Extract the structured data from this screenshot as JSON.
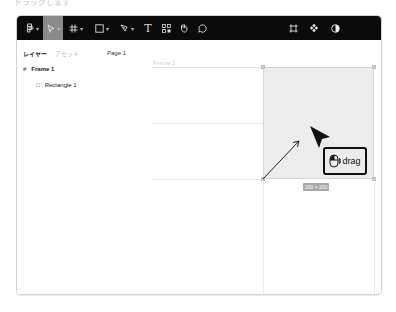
{
  "caption": "ドラッグします",
  "toolbar": {
    "tools": [
      {
        "name": "main-menu",
        "icon": "figma-logo-icon",
        "has_caret": true,
        "active": false
      },
      {
        "name": "move",
        "icon": "cursor-icon",
        "has_caret": true,
        "active": true
      },
      {
        "name": "frame",
        "icon": "frame-hash-icon",
        "has_caret": true,
        "active": false
      },
      {
        "name": "shape",
        "icon": "rectangle-icon",
        "has_caret": true,
        "active": false
      },
      {
        "name": "pen",
        "icon": "pen-icon",
        "has_caret": true,
        "active": false
      },
      {
        "name": "text",
        "icon": "text-icon",
        "label": "T",
        "has_caret": false,
        "active": false
      },
      {
        "name": "resources",
        "icon": "resources-icon",
        "has_caret": false,
        "active": false
      },
      {
        "name": "hand",
        "icon": "hand-icon",
        "has_caret": false,
        "active": false
      },
      {
        "name": "comment",
        "icon": "comment-icon",
        "has_caret": false,
        "active": false
      }
    ],
    "right_tools": [
      {
        "name": "crop",
        "icon": "crop-icon"
      },
      {
        "name": "component",
        "icon": "component-icon"
      },
      {
        "name": "contrast",
        "icon": "contrast-icon"
      }
    ]
  },
  "sidebar": {
    "tabs": [
      {
        "label": "レイヤー",
        "active": true
      },
      {
        "label": "アセット",
        "active": false
      }
    ],
    "page_label": "Page 1",
    "layers": [
      {
        "label": "Frame 1",
        "icon": "#",
        "level": 0
      },
      {
        "label": "Rectangle 1",
        "icon": "□",
        "level": 1
      }
    ]
  },
  "canvas": {
    "frame_label": "Frame 1",
    "size_badge": "200 × 200",
    "drag_hint": "drag",
    "colors": {
      "rect_fill": "#ececec",
      "toolbar_bg": "#0b0b0b",
      "active_tool": "#8a8a8a"
    }
  }
}
